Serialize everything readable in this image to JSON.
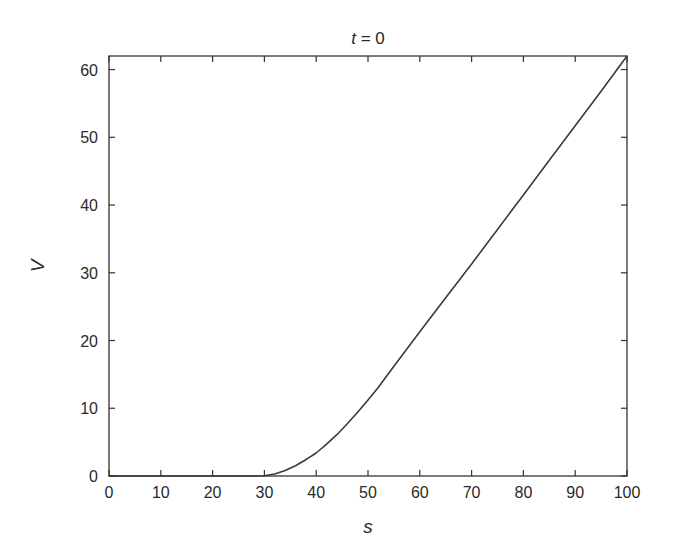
{
  "chart_data": {
    "type": "line",
    "title": "t = 0",
    "title_var": "t",
    "title_rest": " = 0",
    "xlabel": "s",
    "ylabel": "V",
    "xlim": [
      0,
      100
    ],
    "ylim": [
      0,
      62
    ],
    "xticks": [
      0,
      10,
      20,
      30,
      40,
      50,
      60,
      70,
      80,
      90,
      100
    ],
    "yticks": [
      0,
      10,
      20,
      30,
      40,
      50,
      60
    ],
    "grid": false,
    "legend": null,
    "series": [
      {
        "name": "V(s, t=0)",
        "color": "#3a3a3a",
        "x": [
          0,
          10,
          20,
          28,
          30,
          32,
          34,
          36,
          38,
          40,
          42,
          44,
          46,
          48,
          50,
          52,
          55,
          60,
          65,
          70,
          75,
          80,
          85,
          90,
          95,
          100
        ],
        "y": [
          0,
          0,
          0,
          0,
          0.05,
          0.3,
          0.8,
          1.5,
          2.4,
          3.4,
          4.7,
          6.1,
          7.7,
          9.4,
          11.2,
          13.1,
          16.2,
          21.3,
          26.3,
          31.3,
          36.4,
          41.5,
          46.6,
          51.7,
          56.8,
          62
        ]
      }
    ]
  }
}
